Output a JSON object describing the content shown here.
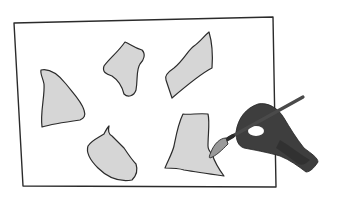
{
  "illustration": {
    "subject": "Hand painting gray shapes on a sheet of paper",
    "colors": {
      "background": "#ffffff",
      "outline": "#2b2b2b",
      "shape_fill": "#d6d6d6",
      "hand": "#3e3e3e",
      "hand_shadow": "#2a2a2a",
      "brush_handle": "#4a4a4a",
      "brush_bristles": "#9a9a9a"
    },
    "shapes": [
      {
        "name": "left-shape"
      },
      {
        "name": "top-middle-shape"
      },
      {
        "name": "top-right-shape"
      },
      {
        "name": "bottom-middle-shape"
      },
      {
        "name": "bottom-right-shape"
      }
    ]
  }
}
